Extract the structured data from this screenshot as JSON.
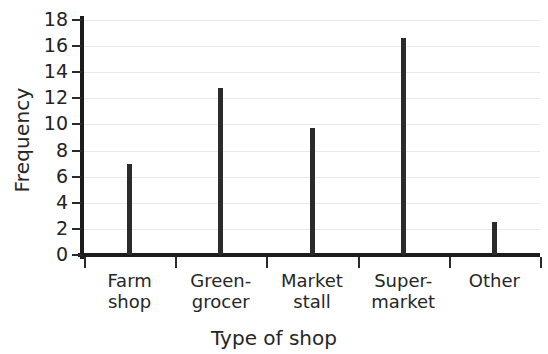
{
  "chart_data": {
    "type": "bar",
    "title": "",
    "xlabel": "Type of shop",
    "ylabel": "Frequency",
    "categories": [
      "Farm shop",
      "Green-grocer",
      "Market stall",
      "Super-market",
      "Other"
    ],
    "category_lines": [
      [
        "Farm",
        "shop"
      ],
      [
        "Green-",
        "grocer"
      ],
      [
        "Market",
        "stall"
      ],
      [
        "Super-",
        "market"
      ],
      [
        "Other",
        ""
      ]
    ],
    "values": [
      7,
      12.8,
      9.7,
      16.6,
      2.5
    ],
    "ylim": [
      0,
      18
    ],
    "ytick_step": 2,
    "yticks": [
      0,
      2,
      4,
      6,
      8,
      10,
      12,
      14,
      16,
      18
    ],
    "ytick_labels": [
      "0",
      "2",
      "4",
      "6",
      "8",
      "10",
      "12",
      "14",
      "16",
      "18"
    ],
    "grid": true,
    "legend": null,
    "bar_color": "#2b2b2b",
    "axis_color": "#1c1c1c",
    "grid_color": "#e9e9ec"
  }
}
